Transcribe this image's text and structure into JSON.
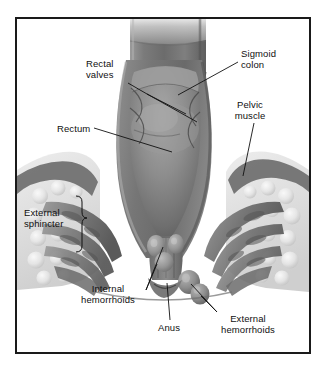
{
  "figure": {
    "type": "medical-illustration",
    "style": "grayscale halftone cutaway cross-section",
    "frame": {
      "border_color": "#1a1a1a",
      "background_color": "#ffffff",
      "border_width_px": 2
    },
    "palette": {
      "background": "#ffffff",
      "outline": "#1a1a1a",
      "leader_line": "#111111",
      "tissue_dark": "#5c5c5c",
      "tissue_mid": "#8a8a8a",
      "tissue_light": "#b8b8b8",
      "lumen_shadow": "#4a4a4a",
      "fat_light": "#e2e2e2",
      "muscle_gray": "#777777",
      "text": "#101010"
    }
  },
  "labels": [
    {
      "id": "rectal-valves",
      "text_lines": [
        "Rectal",
        "valves"
      ],
      "align": "left",
      "x": 86,
      "y": 63
    },
    {
      "id": "sigmoid-colon",
      "text_lines": [
        "Sigmoid",
        "colon"
      ],
      "align": "left",
      "x": 241,
      "y": 53
    },
    {
      "id": "rectum",
      "text_lines": [
        "Rectum"
      ],
      "align": "left",
      "x": 57,
      "y": 123
    },
    {
      "id": "pelvic-muscle",
      "text_lines": [
        "Pelvic",
        "muscle"
      ],
      "align": "center",
      "x": 248,
      "y": 104
    },
    {
      "id": "external-sphincter",
      "text_lines": [
        "External",
        "sphincter"
      ],
      "align": "left",
      "x": 33,
      "y": 212
    },
    {
      "id": "internal-hemorrhoids",
      "text_lines": [
        "Internal",
        "hemorrhoids"
      ],
      "align": "center",
      "x": 108,
      "y": 288
    },
    {
      "id": "anus",
      "text_lines": [
        "Anus"
      ],
      "align": "center",
      "x": 169,
      "y": 325
    },
    {
      "id": "external-hemorrhoids",
      "text_lines": [
        "External",
        "hemorrhoids"
      ],
      "align": "center",
      "x": 248,
      "y": 318
    }
  ],
  "anatomy_parts": [
    {
      "name": "sigmoid colon",
      "description": "tubular bowel segment entering from top of frame"
    },
    {
      "name": "rectal valves",
      "description": "transverse folds on rectal wall"
    },
    {
      "name": "rectum",
      "description": "central cut-away chamber below sigmoid colon"
    },
    {
      "name": "pelvic muscle",
      "description": "levator muscle sheet on right pelvic wall"
    },
    {
      "name": "external sphincter",
      "description": "banded muscle bundles surrounding anal canal, both sides"
    },
    {
      "name": "internal hemorrhoids",
      "description": "swollen vascular cushions inside anal canal"
    },
    {
      "name": "anus",
      "description": "terminal opening of anal canal at bottom center"
    },
    {
      "name": "external hemorrhoids",
      "description": "rounded nodules at the anal verge outside sphincter"
    }
  ]
}
